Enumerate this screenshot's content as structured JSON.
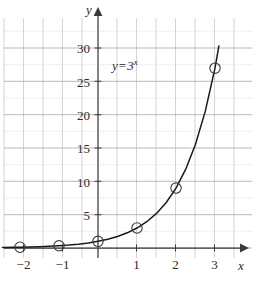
{
  "figure": {
    "name": "exponential-function-graph",
    "equation_label": {
      "lhs": "y",
      "operator": "=",
      "base": "3",
      "exponent": "x"
    }
  },
  "axes": {
    "x_axis_name": "x",
    "y_axis_name": "y",
    "x_tick_labels": [
      "−2",
      "−1",
      "1",
      "2",
      "3"
    ],
    "x_tick_values": [
      -2,
      -1,
      1,
      2,
      3
    ],
    "y_tick_labels": [
      "5",
      "10",
      "15",
      "20",
      "25",
      "30"
    ],
    "y_tick_values": [
      5,
      10,
      15,
      20,
      25,
      30
    ]
  },
  "colors": {
    "curve": "#1a1a1a",
    "axis": "#3a3a3a",
    "grid_major": "#b9b9b9",
    "grid_minor": "#c9c9c9",
    "text": "#2b2b2b",
    "marker_stroke": "#3a3a3a",
    "background": "#ffffff"
  },
  "chart_data": {
    "type": "line",
    "title": "",
    "subtitle": "",
    "xlabel": "x",
    "ylabel": "y",
    "xlim": [
      -2.45,
      3.4
    ],
    "ylim": [
      0,
      30.5
    ],
    "grid": true,
    "grid_major_y_step": 5,
    "grid_minor_y_step": 2.5,
    "grid_x_step": 0.5,
    "legend": null,
    "annotations": [
      {
        "text": "y = 3^x",
        "x": 0.75,
        "y": 23.5
      }
    ],
    "series": [
      {
        "name": "y = 3^x",
        "function": "3^x",
        "marker": "open-circle",
        "x": [
          -2,
          -1,
          0,
          1,
          2,
          3
        ],
        "values": [
          0.111,
          0.333,
          1,
          3,
          9,
          27
        ],
        "value_labels": [
          "1/9",
          "1/3",
          "1",
          "3",
          "9",
          "27"
        ]
      }
    ],
    "curve_x": [
      -2.45,
      -2.2,
      -2,
      -1.75,
      -1.5,
      -1.25,
      -1,
      -0.75,
      -0.5,
      -0.25,
      0,
      0.25,
      0.5,
      0.75,
      1,
      1.25,
      1.5,
      1.75,
      2,
      2.25,
      2.5,
      2.75,
      3,
      3.1
    ],
    "curve_y": [
      0.08,
      0.1,
      0.111,
      0.147,
      0.192,
      0.253,
      0.333,
      0.439,
      0.577,
      0.76,
      1,
      1.316,
      1.732,
      2.28,
      3,
      3.948,
      5.196,
      6.838,
      9,
      11.84,
      15.59,
      20.51,
      27,
      30.34
    ]
  }
}
